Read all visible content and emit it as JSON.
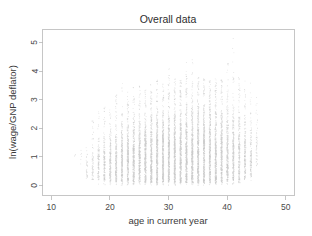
{
  "chart_data": {
    "type": "scatter",
    "title": "Overall data",
    "xlabel": "age in current year",
    "ylabel": "ln(wage/GNP deflator)",
    "xlim": [
      8.5,
      51.5
    ],
    "ylim": [
      -0.35,
      5.45
    ],
    "xticks": [
      10,
      20,
      30,
      40,
      50
    ],
    "yticks": [
      0,
      1,
      2,
      3,
      4,
      5
    ],
    "xtick_labels": [
      "10",
      "20",
      "30",
      "40",
      "50"
    ],
    "ytick_labels": [
      "0",
      "1",
      "2",
      "3",
      "4",
      "5"
    ],
    "grid": false,
    "legend": null,
    "point_color": "#c9c9c9",
    "point_size": 0.6,
    "box": true,
    "series": [
      {
        "name": "observations",
        "columns": [
          {
            "x": 14,
            "n": 3,
            "ymin": 0.95,
            "ymax": 1.15,
            "ycore_lo": 1.0,
            "ycore_hi": 1.1
          },
          {
            "x": 15,
            "n": 6,
            "ymin": 0.3,
            "ymax": 1.6,
            "ycore_lo": 0.6,
            "ycore_hi": 1.4
          },
          {
            "x": 16,
            "n": 34,
            "ymin": 0.05,
            "ymax": 1.95,
            "ycore_lo": 0.25,
            "ycore_hi": 1.55
          },
          {
            "x": 17,
            "n": 70,
            "ymin": 0.02,
            "ymax": 2.45,
            "ycore_lo": 0.2,
            "ycore_hi": 1.75
          },
          {
            "x": 18,
            "n": 120,
            "ymin": 0.02,
            "ymax": 2.6,
            "ycore_lo": 0.2,
            "ycore_hi": 1.95
          },
          {
            "x": 19,
            "n": 165,
            "ymin": 0.02,
            "ymax": 2.75,
            "ycore_lo": 0.15,
            "ycore_hi": 2.1
          },
          {
            "x": 20,
            "n": 200,
            "ymin": 0.02,
            "ymax": 2.95,
            "ycore_lo": 0.15,
            "ycore_hi": 2.2
          },
          {
            "x": 21,
            "n": 235,
            "ymin": 0.02,
            "ymax": 3.35,
            "ycore_lo": 0.15,
            "ycore_hi": 2.35
          },
          {
            "x": 22,
            "n": 265,
            "ymin": 0.02,
            "ymax": 3.85,
            "ycore_lo": 0.12,
            "ycore_hi": 2.45
          },
          {
            "x": 23,
            "n": 290,
            "ymin": 0.02,
            "ymax": 3.3,
            "ycore_lo": 0.12,
            "ycore_hi": 2.55
          },
          {
            "x": 24,
            "n": 315,
            "ymin": 0.02,
            "ymax": 3.45,
            "ycore_lo": 0.12,
            "ycore_hi": 2.65
          },
          {
            "x": 25,
            "n": 335,
            "ymin": 0.02,
            "ymax": 3.5,
            "ycore_lo": 0.12,
            "ycore_hi": 2.7
          },
          {
            "x": 26,
            "n": 355,
            "ymin": 0.02,
            "ymax": 3.4,
            "ycore_lo": 0.1,
            "ycore_hi": 2.8
          },
          {
            "x": 27,
            "n": 370,
            "ymin": 0.02,
            "ymax": 3.55,
            "ycore_lo": 0.1,
            "ycore_hi": 2.85
          },
          {
            "x": 28,
            "n": 385,
            "ymin": 0.02,
            "ymax": 3.7,
            "ycore_lo": 0.1,
            "ycore_hi": 2.9
          },
          {
            "x": 29,
            "n": 395,
            "ymin": 0.02,
            "ymax": 3.6,
            "ycore_lo": 0.1,
            "ycore_hi": 2.95
          },
          {
            "x": 30,
            "n": 410,
            "ymin": 0.02,
            "ymax": 4.1,
            "ycore_lo": 0.1,
            "ycore_hi": 3.0
          },
          {
            "x": 31,
            "n": 415,
            "ymin": 0.02,
            "ymax": 3.75,
            "ycore_lo": 0.1,
            "ycore_hi": 3.0
          },
          {
            "x": 32,
            "n": 420,
            "ymin": 0.02,
            "ymax": 3.7,
            "ycore_lo": 0.1,
            "ycore_hi": 3.05
          },
          {
            "x": 33,
            "n": 420,
            "ymin": 0.02,
            "ymax": 4.35,
            "ycore_lo": 0.1,
            "ycore_hi": 3.05
          },
          {
            "x": 34,
            "n": 415,
            "ymin": 0.02,
            "ymax": 4.7,
            "ycore_lo": 0.1,
            "ycore_hi": 3.05
          },
          {
            "x": 35,
            "n": 410,
            "ymin": 0.02,
            "ymax": 3.8,
            "ycore_lo": 0.1,
            "ycore_hi": 3.1
          },
          {
            "x": 36,
            "n": 400,
            "ymin": 0.02,
            "ymax": 3.75,
            "ycore_lo": 0.1,
            "ycore_hi": 3.1
          },
          {
            "x": 37,
            "n": 390,
            "ymin": 0.02,
            "ymax": 3.7,
            "ycore_lo": 0.1,
            "ycore_hi": 3.05
          },
          {
            "x": 38,
            "n": 375,
            "ymin": 0.02,
            "ymax": 3.75,
            "ycore_lo": 0.1,
            "ycore_hi": 3.05
          },
          {
            "x": 39,
            "n": 355,
            "ymin": 0.02,
            "ymax": 3.7,
            "ycore_lo": 0.1,
            "ycore_hi": 3.0
          },
          {
            "x": 40,
            "n": 320,
            "ymin": 0.05,
            "ymax": 4.3,
            "ycore_lo": 0.15,
            "ycore_hi": 3.0
          },
          {
            "x": 41,
            "n": 290,
            "ymin": 0.05,
            "ymax": 5.2,
            "ycore_lo": 0.15,
            "ycore_hi": 2.95
          },
          {
            "x": 42,
            "n": 245,
            "ymin": 0.05,
            "ymax": 3.8,
            "ycore_lo": 0.15,
            "ycore_hi": 2.9
          },
          {
            "x": 43,
            "n": 195,
            "ymin": 0.1,
            "ymax": 4.0,
            "ycore_lo": 0.2,
            "ycore_hi": 2.9
          },
          {
            "x": 44,
            "n": 140,
            "ymin": 0.15,
            "ymax": 3.95,
            "ycore_lo": 0.3,
            "ycore_hi": 2.85
          },
          {
            "x": 45,
            "n": 55,
            "ymin": 0.35,
            "ymax": 3.15,
            "ycore_lo": 0.7,
            "ycore_hi": 2.8
          }
        ]
      }
    ]
  }
}
